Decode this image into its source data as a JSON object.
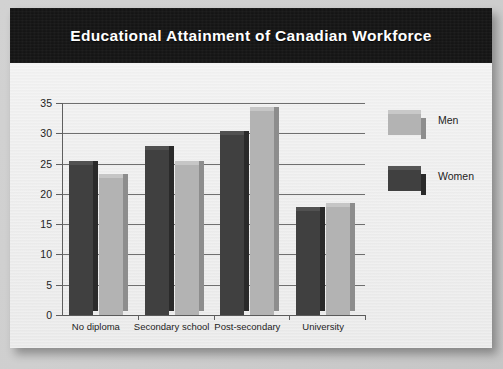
{
  "slide": {
    "title": "Educational Attainment of Canadian Workforce"
  },
  "chart_data": {
    "type": "bar",
    "title": "Educational Attainment of Canadian Workforce",
    "xlabel": "",
    "ylabel": "",
    "ylim": [
      0,
      35
    ],
    "yticks": [
      0,
      5,
      10,
      15,
      20,
      25,
      30,
      35
    ],
    "grid": true,
    "legend_position": "right",
    "categories": [
      "No diploma",
      "Secondary school",
      "Post-secondary",
      "University"
    ],
    "series": [
      {
        "name": "Women",
        "color": "#404040",
        "values": [
          24.8,
          27.2,
          29.7,
          17.2
        ]
      },
      {
        "name": "Men",
        "color": "#b3b3b3",
        "values": [
          22.7,
          24.7,
          33.6,
          17.9
        ]
      }
    ],
    "bar_order_in_group": [
      "Women",
      "Men"
    ]
  },
  "legend": {
    "items": [
      {
        "label": "Men",
        "color": "#b3b3b3"
      },
      {
        "label": "Women",
        "color": "#404040"
      }
    ]
  },
  "colors": {
    "title_band": "#151515",
    "title_text": "#ffffff",
    "card_background": "#eeeeee",
    "men": "#b3b3b3",
    "women": "#404040",
    "axis": "#5f5f5f"
  }
}
